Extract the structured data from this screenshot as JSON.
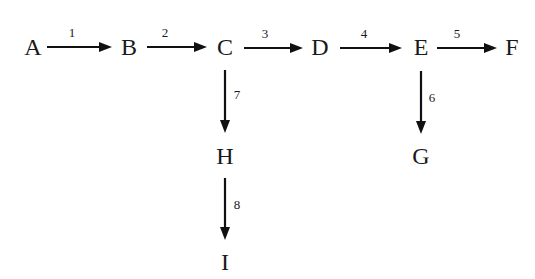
{
  "diagram": {
    "type": "flow-network",
    "background": "#ffffff",
    "ink_color": "#111111",
    "nodes": [
      {
        "id": "A",
        "label": "A",
        "x": 33,
        "y": 47
      },
      {
        "id": "B",
        "label": "B",
        "x": 129,
        "y": 47
      },
      {
        "id": "C",
        "label": "C",
        "x": 225,
        "y": 47
      },
      {
        "id": "D",
        "label": "D",
        "x": 320,
        "y": 47
      },
      {
        "id": "E",
        "label": "E",
        "x": 421,
        "y": 47
      },
      {
        "id": "F",
        "label": "F",
        "x": 512,
        "y": 47
      },
      {
        "id": "G",
        "label": "G",
        "x": 421,
        "y": 156
      },
      {
        "id": "H",
        "label": "H",
        "x": 225,
        "y": 156
      },
      {
        "id": "I",
        "label": "I",
        "x": 225,
        "y": 262
      }
    ],
    "edges": [
      {
        "id": "e1",
        "label": "1",
        "from": "A",
        "to": "B",
        "x1": 47,
        "y1": 47,
        "x2": 112,
        "y2": 47,
        "lx": 72,
        "ly": 34,
        "dir": "right"
      },
      {
        "id": "e2",
        "label": "2",
        "from": "B",
        "to": "C",
        "x1": 147,
        "y1": 47,
        "x2": 207,
        "y2": 47,
        "lx": 165,
        "ly": 34,
        "dir": "right"
      },
      {
        "id": "e3",
        "label": "3",
        "from": "C",
        "to": "D",
        "x1": 244,
        "y1": 48,
        "x2": 303,
        "y2": 48,
        "lx": 265,
        "ly": 35,
        "dir": "right"
      },
      {
        "id": "e4",
        "label": "4",
        "from": "D",
        "to": "E",
        "x1": 340,
        "y1": 48,
        "x2": 402,
        "y2": 48,
        "lx": 364,
        "ly": 35,
        "dir": "right"
      },
      {
        "id": "e5",
        "label": "5",
        "from": "E",
        "to": "F",
        "x1": 437,
        "y1": 48,
        "x2": 497,
        "y2": 48,
        "lx": 457,
        "ly": 35,
        "dir": "right"
      },
      {
        "id": "e6",
        "label": "6",
        "from": "E",
        "to": "G",
        "x1": 421,
        "y1": 71,
        "x2": 421,
        "y2": 134,
        "lx": 432,
        "ly": 99,
        "dir": "down"
      },
      {
        "id": "e7",
        "label": "7",
        "from": "C",
        "to": "H",
        "x1": 225,
        "y1": 70,
        "x2": 225,
        "y2": 133,
        "lx": 237,
        "ly": 96,
        "dir": "down"
      },
      {
        "id": "e8",
        "label": "8",
        "from": "H",
        "to": "I",
        "x1": 225,
        "y1": 178,
        "x2": 225,
        "y2": 240,
        "lx": 237,
        "ly": 206,
        "dir": "down"
      }
    ]
  }
}
